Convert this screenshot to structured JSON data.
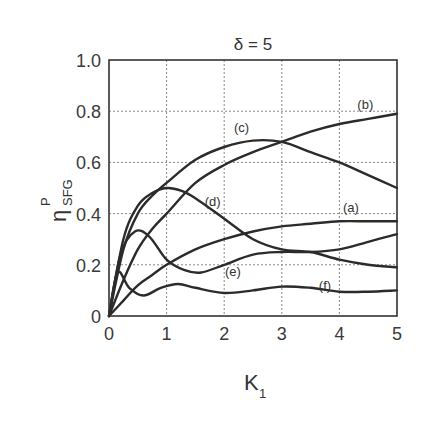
{
  "chart_data": {
    "type": "line",
    "title": "δ = 5",
    "xlabel": "K",
    "xlabel_subscript": "1",
    "ylabel": "η",
    "ylabel_superscript": "P",
    "ylabel_subscript": "SFG",
    "xlim": [
      0,
      5
    ],
    "ylim": [
      0,
      1.0
    ],
    "xticks": [
      "0",
      "1",
      "2",
      "3",
      "4",
      "5"
    ],
    "yticks": [
      "0",
      "0.2",
      "0.4",
      "0.6",
      "0.8",
      "1.0"
    ],
    "grid": true,
    "legend": "none (curves labeled inline)",
    "series": [
      {
        "name": "(a)",
        "label_pos": [
          4.2,
          0.405
        ],
        "x": [
          0,
          0.25,
          0.5,
          0.75,
          1.0,
          1.5,
          2.0,
          2.5,
          3.0,
          3.5,
          4.0,
          4.5,
          5.0
        ],
        "values": [
          0,
          0.06,
          0.12,
          0.16,
          0.2,
          0.26,
          0.3,
          0.33,
          0.35,
          0.36,
          0.37,
          0.37,
          0.37
        ]
      },
      {
        "name": "(b)",
        "label_pos": [
          4.45,
          0.81
        ],
        "x": [
          0,
          0.25,
          0.5,
          0.75,
          1.0,
          1.5,
          2.0,
          2.5,
          3.0,
          3.5,
          4.0,
          4.5,
          5.0
        ],
        "values": [
          0,
          0.14,
          0.26,
          0.34,
          0.4,
          0.52,
          0.59,
          0.64,
          0.68,
          0.72,
          0.75,
          0.77,
          0.79
        ]
      },
      {
        "name": "(c)",
        "label_pos": [
          2.3,
          0.72
        ],
        "x": [
          0,
          0.25,
          0.5,
          0.75,
          1.0,
          1.5,
          2.0,
          2.5,
          3.0,
          3.5,
          4.0,
          4.5,
          5.0
        ],
        "values": [
          0,
          0.26,
          0.4,
          0.47,
          0.52,
          0.61,
          0.66,
          0.685,
          0.68,
          0.64,
          0.6,
          0.55,
          0.5
        ]
      },
      {
        "name": "(d)",
        "label_pos": [
          1.8,
          0.43
        ],
        "x": [
          0,
          0.25,
          0.5,
          0.75,
          1.0,
          1.25,
          1.5,
          2.0,
          2.5,
          3.0,
          3.5,
          4.0,
          4.5,
          5.0
        ],
        "values": [
          0,
          0.3,
          0.43,
          0.48,
          0.5,
          0.49,
          0.46,
          0.38,
          0.3,
          0.26,
          0.25,
          0.22,
          0.2,
          0.19
        ]
      },
      {
        "name": "(e)",
        "label_pos": [
          2.15,
          0.155
        ],
        "x": [
          0,
          0.2,
          0.45,
          0.7,
          1.0,
          1.3,
          1.6,
          2.0,
          2.5,
          3.0,
          3.5,
          4.0,
          4.5,
          5.0
        ],
        "values": [
          0,
          0.24,
          0.33,
          0.31,
          0.22,
          0.18,
          0.17,
          0.2,
          0.24,
          0.25,
          0.25,
          0.26,
          0.29,
          0.32
        ]
      },
      {
        "name": "(f)",
        "label_pos": [
          3.75,
          0.1
        ],
        "x": [
          0,
          0.15,
          0.35,
          0.6,
          0.9,
          1.2,
          1.5,
          2.0,
          2.5,
          3.0,
          3.5,
          4.0,
          4.5,
          5.0
        ],
        "values": [
          0,
          0.17,
          0.11,
          0.08,
          0.11,
          0.125,
          0.11,
          0.09,
          0.1,
          0.115,
          0.11,
          0.095,
          0.095,
          0.1
        ]
      }
    ]
  }
}
